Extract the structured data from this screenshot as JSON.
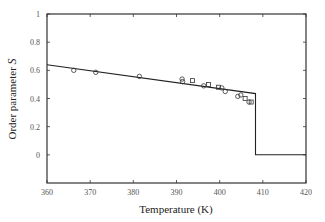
{
  "chart_data": {
    "type": "scatter",
    "title": "",
    "xlabel": "Temperature (K)",
    "ylabel": "Order parameter S",
    "xlim": [
      360,
      420
    ],
    "ylim": [
      -0.2,
      1
    ],
    "xticks": [
      360,
      370,
      380,
      390,
      400,
      410,
      420
    ],
    "yticks": [
      0,
      0.2,
      0.4,
      0.6,
      0.8,
      1
    ],
    "ytick_labels": [
      "0",
      "0.2",
      "0.4",
      "0.6",
      "0.8",
      "1"
    ],
    "grid": false,
    "legend": null,
    "series": [
      {
        "name": "theory",
        "type": "line",
        "x": [
          360,
          408.3,
          408.3,
          420
        ],
        "y": [
          0.64,
          0.435,
          0.0,
          0.0
        ]
      },
      {
        "name": "circles",
        "type": "scatter",
        "marker": "circle",
        "x": [
          366.2,
          371.3,
          381.4,
          391.3,
          391.4,
          396.3,
          400.5,
          401.3,
          404.2,
          404.9,
          406.8
        ],
        "y": [
          0.6,
          0.586,
          0.557,
          0.538,
          0.52,
          0.49,
          0.475,
          0.45,
          0.415,
          0.425,
          0.375
        ]
      },
      {
        "name": "squares",
        "type": "scatter",
        "marker": "square",
        "x": [
          393.7,
          397.4,
          399.7,
          405.9,
          407.3
        ],
        "y": [
          0.527,
          0.5,
          0.48,
          0.4,
          0.375
        ]
      }
    ]
  }
}
